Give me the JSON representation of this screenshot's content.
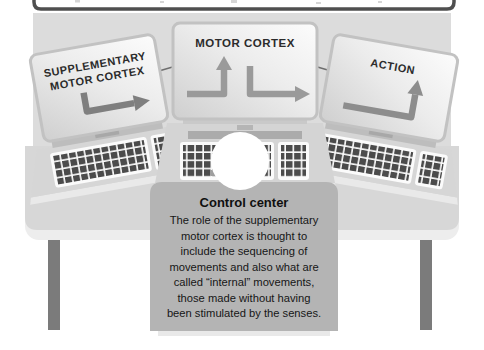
{
  "monitors": [
    {
      "name": "supplementary-motor-cortex",
      "label_lines": [
        "SUPPLEMENTARY",
        "MOTOR CORTEX"
      ],
      "arrow_icons": [
        "elbow-arrow-down-then-right"
      ]
    },
    {
      "name": "motor-cortex",
      "label": "MOTOR CORTEX",
      "arrow_icons": [
        "elbow-arrow-right-then-up",
        "elbow-arrow-down-then-right"
      ]
    },
    {
      "name": "action",
      "label": "ACTION",
      "arrow_icons": [
        "elbow-arrow-right-then-up"
      ]
    }
  ],
  "control_center": {
    "title": "Control center",
    "lines": [
      "The role of the supplementary",
      "motor cortex is thought to",
      "include the sequencing of",
      "movements and also what are",
      "called “internal” movements,",
      "those made without having",
      "been stimulated by the senses."
    ]
  },
  "colors": {
    "backdrop": "#dcdcdc",
    "board_frame": "#4f4f4f",
    "desk_surface": "#d7d7d7",
    "desk_edge": "#ededed",
    "desk_leg": "#7b7b7b",
    "panel": "#b4b4b4",
    "screen_text": "#2b2b2b",
    "arrow_gray": "#868686",
    "keyboard_keys": "#4b4b4b",
    "circle": "#ffffff"
  }
}
